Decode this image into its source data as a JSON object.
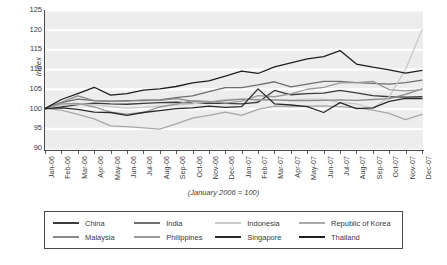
{
  "chart_data": {
    "type": "line",
    "title": "",
    "subtitle": "",
    "caption": "(January 2006 = 100)",
    "xlabel": "",
    "ylabel": "Index",
    "ylim": [
      90,
      125
    ],
    "yticks": [
      90,
      95,
      100,
      105,
      110,
      115,
      120,
      125
    ],
    "grid": "horizontal-white-on-gray",
    "legend_position": "bottom-boxed",
    "x": [
      "Jan-06",
      "Feb-06",
      "Mar-06",
      "Apr-06",
      "May-06",
      "Jun-06",
      "Jul-06",
      "Aug-06",
      "Sep-06",
      "Oct-06",
      "Nov-06",
      "Dec-06",
      "Jan-07",
      "Feb-07",
      "Mar-07",
      "Apr-07",
      "May-07",
      "Jun-07",
      "Jul-07",
      "Aug-07",
      "Sep-07",
      "Oct-07",
      "Nov-07",
      "Dec-07"
    ],
    "series": [
      {
        "name": "China",
        "color": "#3b3b3b",
        "values": [
          100.0,
          100.4,
          101.0,
          101.4,
          101.2,
          101.1,
          101.3,
          101.5,
          101.6,
          101.4,
          101.3,
          101.3,
          101.2,
          101.6,
          104.6,
          103.5,
          103.8,
          103.9,
          104.6,
          104.0,
          103.3,
          103.0,
          102.9,
          103.0
        ]
      },
      {
        "name": "India",
        "color": "#6e6e6e",
        "values": [
          100.0,
          101.5,
          102.4,
          102.0,
          101.8,
          102.0,
          102.0,
          102.2,
          102.8,
          103.2,
          104.3,
          105.3,
          105.3,
          106.0,
          106.8,
          105.5,
          106.2,
          106.9,
          106.9,
          106.6,
          106.4,
          106.2,
          106.6,
          107.2
        ]
      },
      {
        "name": "Indonesia",
        "color": "#c9c9c9",
        "values": [
          100.0,
          100.8,
          101.2,
          101.0,
          100.5,
          100.1,
          100.3,
          100.6,
          100.9,
          101.2,
          101.7,
          102.3,
          102.4,
          102.3,
          102.2,
          102.2,
          102.4,
          102.4,
          101.5,
          101.2,
          100.0,
          103.0,
          110.0,
          120.0
        ]
      },
      {
        "name": "Republic of Korea",
        "color": "#a8a8a8",
        "values": [
          100.0,
          99.6,
          98.5,
          97.4,
          95.6,
          95.4,
          95.1,
          94.8,
          96.1,
          97.6,
          98.3,
          99.1,
          98.3,
          99.8,
          100.6,
          100.5,
          100.6,
          100.7,
          100.5,
          100.2,
          99.6,
          98.8,
          97.2,
          98.5
        ]
      },
      {
        "name": "Malaysia",
        "color": "#8a8a8a",
        "values": [
          100.0,
          101.6,
          103.2,
          102.0,
          101.9,
          101.9,
          102.2,
          102.1,
          102.5,
          101.9,
          101.6,
          102.0,
          102.4,
          102.2,
          102.2,
          102.0,
          102.0,
          102.1,
          102.2,
          102.1,
          102.3,
          102.5,
          103.6,
          105.0
        ]
      },
      {
        "name": "Philippines",
        "color": "#9a9a9a",
        "values": [
          100.0,
          101.2,
          101.3,
          100.4,
          99.1,
          98.6,
          99.0,
          100.4,
          101.1,
          102.0,
          101.8,
          101.4,
          101.9,
          103.3,
          103.0,
          103.7,
          104.9,
          105.4,
          106.5,
          106.6,
          106.9,
          104.8,
          104.5,
          104.8
        ]
      },
      {
        "name": "Singapore",
        "color": "#2a2a2a",
        "values": [
          100.0,
          100.2,
          99.8,
          99.1,
          99.0,
          98.3,
          99.0,
          99.5,
          100.0,
          100.2,
          100.6,
          100.3,
          100.5,
          105.0,
          101.2,
          100.9,
          100.5,
          99.0,
          101.5,
          100.0,
          100.2,
          101.8,
          102.6,
          102.5
        ]
      },
      {
        "name": "Thailand",
        "color": "#1f1f1f",
        "values": [
          100.0,
          102.3,
          103.8,
          105.4,
          103.4,
          103.8,
          104.7,
          105.0,
          105.6,
          106.5,
          107.0,
          108.2,
          109.5,
          108.9,
          110.6,
          111.6,
          112.6,
          113.2,
          114.7,
          111.3,
          110.5,
          109.8,
          109.0,
          109.7
        ]
      }
    ]
  },
  "legend": {
    "rows": [
      [
        {
          "label": "China",
          "color": "#3b3b3b"
        },
        {
          "label": "India",
          "color": "#6e6e6e"
        },
        {
          "label": "Indonesia",
          "color": "#c9c9c9"
        },
        {
          "label": "Republic of Korea",
          "color": "#a8a8a8"
        }
      ],
      [
        {
          "label": "Malaysia",
          "color": "#8a8a8a"
        },
        {
          "label": "Philippines",
          "color": "#9a9a9a"
        },
        {
          "label": "Singapore",
          "color": "#2a2a2a"
        },
        {
          "label": "Thailand",
          "color": "#1f1f1f"
        }
      ]
    ]
  }
}
